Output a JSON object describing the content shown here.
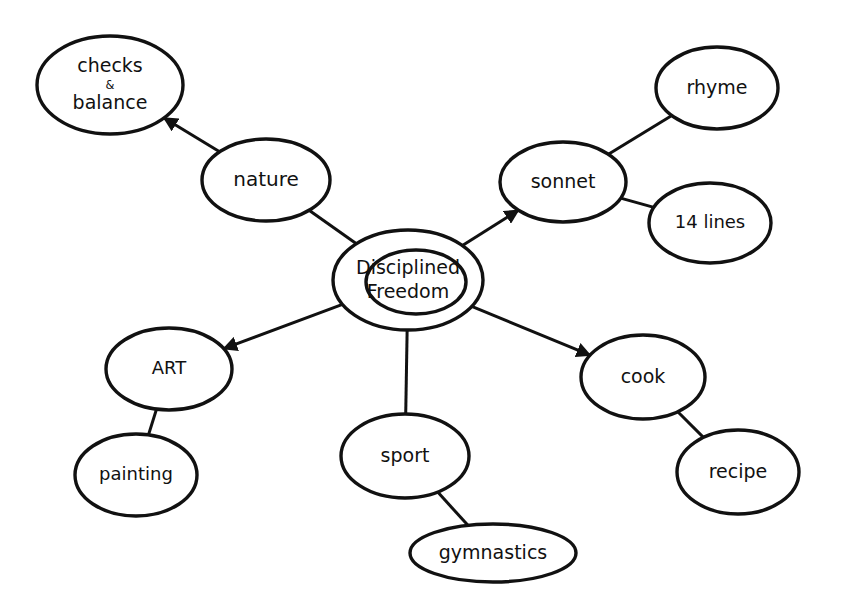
{
  "diagram": {
    "type": "mind-map",
    "colors": {
      "stroke": "#111111",
      "background": "#ffffff"
    },
    "nodes": [
      {
        "id": "center",
        "lines": [
          "Disciplined",
          "Freedom"
        ]
      },
      {
        "id": "nature",
        "lines": [
          "nature"
        ]
      },
      {
        "id": "checks",
        "lines": [
          "checks",
          "&",
          "balance"
        ]
      },
      {
        "id": "sonnet",
        "lines": [
          "sonnet"
        ]
      },
      {
        "id": "rhyme",
        "lines": [
          "rhyme"
        ]
      },
      {
        "id": "lines14",
        "lines": [
          "14 lines"
        ]
      },
      {
        "id": "art",
        "lines": [
          "ART"
        ]
      },
      {
        "id": "painting",
        "lines": [
          "painting"
        ]
      },
      {
        "id": "sport",
        "lines": [
          "sport"
        ]
      },
      {
        "id": "gymnastics",
        "lines": [
          "gymnastics"
        ]
      },
      {
        "id": "cook",
        "lines": [
          "cook"
        ]
      },
      {
        "id": "recipe",
        "lines": [
          "recipe"
        ]
      }
    ],
    "edges": [
      {
        "from": "center",
        "to": "nature",
        "arrow": false
      },
      {
        "from": "nature",
        "to": "checks",
        "arrow": true
      },
      {
        "from": "center",
        "to": "sonnet",
        "arrow": true
      },
      {
        "from": "sonnet",
        "to": "rhyme",
        "arrow": false
      },
      {
        "from": "sonnet",
        "to": "lines14",
        "arrow": false
      },
      {
        "from": "center",
        "to": "art",
        "arrow": true
      },
      {
        "from": "art",
        "to": "painting",
        "arrow": false
      },
      {
        "from": "center",
        "to": "sport",
        "arrow": false
      },
      {
        "from": "sport",
        "to": "gymnastics",
        "arrow": false
      },
      {
        "from": "center",
        "to": "cook",
        "arrow": true
      },
      {
        "from": "cook",
        "to": "recipe",
        "arrow": false
      }
    ]
  }
}
